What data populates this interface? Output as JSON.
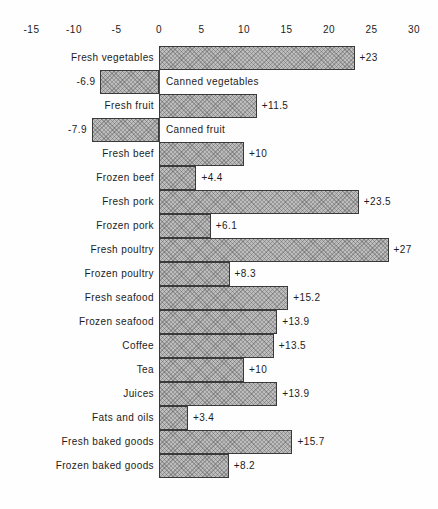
{
  "chart_data": {
    "type": "bar",
    "orientation": "horizontal",
    "title": "",
    "xlabel": "",
    "ylabel": "",
    "xlim": [
      -15,
      30
    ],
    "grid": false,
    "legend": false,
    "x_ticks": [
      -15,
      -10,
      -5,
      0,
      5,
      10,
      15,
      20,
      25,
      30
    ],
    "x_tick_labels": [
      "-15",
      "-10",
      "-5",
      "0",
      "5",
      "10",
      "15",
      "20",
      "25",
      "30"
    ],
    "categories": [
      "Fresh vegetables",
      "Canned vegetables",
      "Fresh fruit",
      "Canned fruit",
      "Fresh beef",
      "Frozen beef",
      "Fresh pork",
      "Frozen pork",
      "Fresh poultry",
      "Frozen poultry",
      "Fresh seafood",
      "Frozen seafood",
      "Coffee",
      "Tea",
      "Juices",
      "Fats and oils",
      "Fresh baked goods",
      "Frozen baked goods"
    ],
    "values": [
      23,
      -6.9,
      11.5,
      -7.9,
      10,
      4.4,
      23.5,
      6.1,
      27,
      8.3,
      15.2,
      13.9,
      13.5,
      10,
      13.9,
      3.4,
      15.7,
      8.2
    ],
    "value_labels": [
      "+23",
      "-6.9",
      "+11.5",
      "-7.9",
      "+10",
      "+4.4",
      "+23.5",
      "+6.1",
      "+27",
      "+8.3",
      "+15.2",
      "+13.9",
      "+13.5",
      "+10",
      "+13.9",
      "+3.4",
      "+15.7",
      "+8.2"
    ],
    "colors": {
      "bar_fill": "#bdbdbd",
      "bar_border": "#3a3a3a",
      "text": "#1c1c1c",
      "background": "#fefefe",
      "zero_line": "#4a4a4a"
    }
  }
}
